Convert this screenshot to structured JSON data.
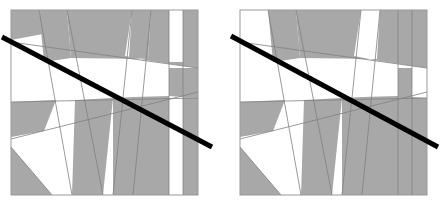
{
  "figure": {
    "type": "geometric-diagram",
    "background_color": "#ffffff",
    "panel_count": 2,
    "colors": {
      "shaded_fill": "#a8a8a8",
      "unshaded_fill": "#ffffff",
      "partition_stroke": "#808080",
      "square_border": "#999999",
      "diagonal_line": "#000000"
    },
    "stroke_widths": {
      "partition": 0.8,
      "square_border": 1.0,
      "diagonal_line": 5.0
    }
  },
  "panels": [
    {
      "name": "left-panel",
      "label": "",
      "square": {
        "x": 11,
        "y": 10,
        "width": 187,
        "height": 185
      },
      "diagonal": {
        "x1": 2,
        "y1": 37,
        "x2": 212,
        "y2": 147
      },
      "cut_lines": [
        {
          "name": "cut-a",
          "x1": 11,
          "y1": 42,
          "x2": 198,
          "y2": 68
        },
        {
          "name": "cut-b",
          "x1": 11,
          "y1": 102,
          "x2": 198,
          "y2": 98
        },
        {
          "name": "cut-c",
          "x1": 11,
          "y1": 139,
          "x2": 198,
          "y2": 92
        },
        {
          "name": "cut-d",
          "x1": 39,
          "y1": 10,
          "x2": 72,
          "y2": 195
        },
        {
          "name": "cut-e",
          "x1": 67,
          "y1": 10,
          "x2": 103,
          "y2": 195
        },
        {
          "name": "cut-f",
          "x1": 132,
          "y1": 10,
          "x2": 113,
          "y2": 195
        },
        {
          "name": "cut-g",
          "x1": 151,
          "y1": 10,
          "x2": 133,
          "y2": 195
        },
        {
          "name": "cut-h",
          "x1": 11,
          "y1": 147,
          "x2": 52,
          "y2": 195
        },
        {
          "name": "cut-i",
          "x1": 169,
          "y1": 10,
          "x2": 169,
          "y2": 195
        },
        {
          "name": "cut-j",
          "x1": 183,
          "y1": 10,
          "x2": 183,
          "y2": 195
        }
      ]
    },
    {
      "name": "right-panel",
      "label": "",
      "square": {
        "x": 240,
        "y": 10,
        "width": 187,
        "height": 185
      },
      "diagonal": {
        "x1": 231,
        "y1": 36,
        "x2": 438,
        "y2": 147
      },
      "cut_lines": [
        {
          "name": "cut-a",
          "x1": 240,
          "y1": 42,
          "x2": 427,
          "y2": 68
        },
        {
          "name": "cut-b",
          "x1": 240,
          "y1": 102,
          "x2": 427,
          "y2": 98
        },
        {
          "name": "cut-c",
          "x1": 240,
          "y1": 139,
          "x2": 427,
          "y2": 92
        },
        {
          "name": "cut-d",
          "x1": 268,
          "y1": 10,
          "x2": 301,
          "y2": 195
        },
        {
          "name": "cut-e",
          "x1": 296,
          "y1": 10,
          "x2": 332,
          "y2": 195
        },
        {
          "name": "cut-f",
          "x1": 361,
          "y1": 10,
          "x2": 342,
          "y2": 195
        },
        {
          "name": "cut-g",
          "x1": 380,
          "y1": 10,
          "x2": 362,
          "y2": 195
        },
        {
          "name": "cut-h",
          "x1": 240,
          "y1": 147,
          "x2": 281,
          "y2": 195
        },
        {
          "name": "cut-i",
          "x1": 398,
          "y1": 10,
          "x2": 398,
          "y2": 195
        },
        {
          "name": "cut-j",
          "x1": 412,
          "y1": 10,
          "x2": 412,
          "y2": 195
        }
      ]
    }
  ],
  "shaded_regions": {
    "left": [
      "M11,10 L39,10 L43,34 L11,40 Z",
      "M39,10 L67,10 L71,58 L44,62 Z",
      "M67,10 L132,10 L125,56 L151,61 L198,68 L198,10 L183,10 L183,62 L169,62 L169,10 L151,10 L148,59 L71,58 Z",
      "M132,10 L151,10 L148,59 L129,58 Z",
      "M169,68 L183,68 L183,97 L169,96 Z",
      "M183,68 L198,68 L198,98 L183,97 Z",
      "M11,102 L56,100 L44,131 L11,137 Z",
      "M75,100 L113,98 L103,195 L72,195 Z",
      "M113,98 L133,97 L133,195 L113,195 Z",
      "M133,97 L169,96 L169,195 L133,195 Z",
      "M11,147 L52,195 L11,195 Z",
      "M183,97 L198,98 L198,195 L183,195 Z"
    ],
    "right": [
      "M296,10 L361,10 L354,56 L380,61 L427,68 L427,10 L412,10 L412,62 L398,62 L398,10 L380,10 L377,59 L300,58 Z",
      "M398,10 L412,10 L412,62 L398,62 Z",
      "M398,68 L412,68 L412,195 L398,195 Z",
      "M240,102 L285,100 L273,131 L240,137 Z",
      "M304,100 L342,98 L332,195 L301,195 Z",
      "M342,98 L362,97 L362,195 L342,195 Z",
      "M362,97 L398,96 L398,195 L362,195 Z",
      "M240,147 L281,195 L240,195 Z",
      "M412,97 L427,98 L427,195 L412,195 Z",
      "M268,10 L296,10 L300,58 L273,62 Z"
    ]
  }
}
